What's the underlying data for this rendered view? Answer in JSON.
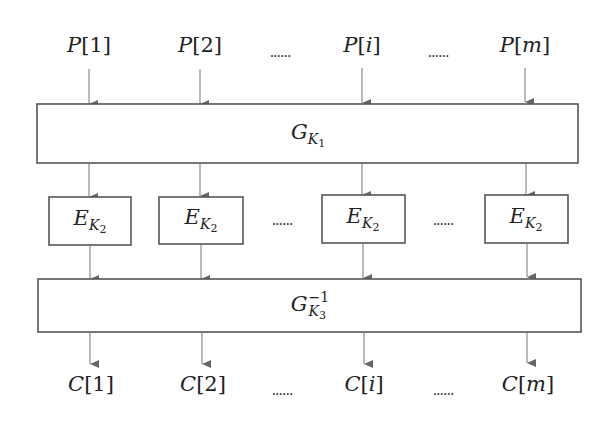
{
  "diagram": {
    "type": "block-cipher-structure",
    "inputs": {
      "prefix": "P",
      "labels": [
        "P[1]",
        "P[2]",
        "P[i]",
        "P[m]"
      ],
      "indices": [
        "1",
        "2",
        "i",
        "m"
      ],
      "ellipsis": "......"
    },
    "top_block": {
      "label": "G",
      "subscript": "K",
      "subsubscript": "1",
      "full": "G_{K_1}"
    },
    "middle_blocks": {
      "label": "E",
      "subscript": "K",
      "subsubscript": "2",
      "full": "E_{K_2}",
      "count_shown": 4
    },
    "bottom_block": {
      "label": "G",
      "superscript": "−1",
      "subscript": "K",
      "subsubscript": "3",
      "full": "G^{-1}_{K_3}"
    },
    "outputs": {
      "prefix": "C",
      "labels": [
        "C[1]",
        "C[2]",
        "C[i]",
        "C[m]"
      ],
      "indices": [
        "1",
        "2",
        "i",
        "m"
      ],
      "ellipsis": "......"
    },
    "colors": {
      "stroke": "#555555",
      "arrow": "#666666",
      "text": "#222222",
      "background": "#ffffff"
    }
  }
}
